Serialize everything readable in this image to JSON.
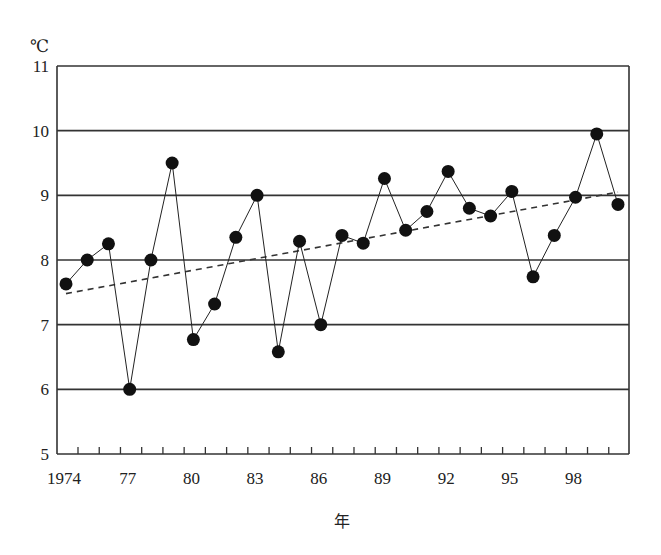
{
  "chart_data": {
    "type": "line",
    "title": "",
    "xlabel": "年",
    "ylabel": "℃",
    "ylim": [
      5,
      11
    ],
    "yticks": [
      5,
      6,
      7,
      8,
      9,
      10,
      11
    ],
    "xtick_labels": [
      {
        "year": 1974,
        "label": "1974"
      },
      {
        "year": 1977,
        "label": "77"
      },
      {
        "year": 1980,
        "label": "80"
      },
      {
        "year": 1983,
        "label": "83"
      },
      {
        "year": 1986,
        "label": "86"
      },
      {
        "year": 1989,
        "label": "89"
      },
      {
        "year": 1992,
        "label": "92"
      },
      {
        "year": 1995,
        "label": "95"
      },
      {
        "year": 1998,
        "label": "98"
      }
    ],
    "grid": {
      "horizontal": true,
      "vertical": false
    },
    "legend": null,
    "series": [
      {
        "name": "annual mean temperature",
        "style": "solid line with filled circle markers",
        "x": [
          1974,
          1975,
          1976,
          1977,
          1978,
          1979,
          1980,
          1981,
          1982,
          1983,
          1984,
          1985,
          1986,
          1987,
          1988,
          1989,
          1990,
          1991,
          1992,
          1993,
          1994,
          1995,
          1996,
          1997,
          1998,
          1999,
          2000
        ],
        "values": [
          7.63,
          8.0,
          8.25,
          6.0,
          8.0,
          9.5,
          6.77,
          7.32,
          8.35,
          9.0,
          6.58,
          8.29,
          7.0,
          8.38,
          8.26,
          9.26,
          8.46,
          8.75,
          9.37,
          8.8,
          8.68,
          9.06,
          7.74,
          8.38,
          8.97,
          9.95,
          8.86
        ]
      },
      {
        "name": "linear trend",
        "style": "dashed line",
        "x": [
          1974,
          2000
        ],
        "values": [
          7.48,
          9.05
        ]
      }
    ]
  },
  "colors": {
    "axis": "#333333",
    "grid": "#333333",
    "series": "#222222",
    "marker": "#111111",
    "trend": "#333333",
    "background": "#ffffff"
  }
}
